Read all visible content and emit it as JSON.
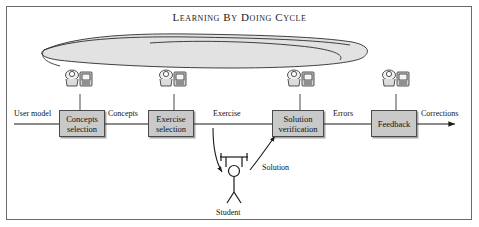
{
  "diagram": {
    "title": "Learning By Doing Cycle",
    "boxes": [
      {
        "id": "concepts-selection",
        "label": "Concepts selection",
        "line1": "Concepts",
        "line2": "selection",
        "x": 59,
        "y": 110,
        "w": 46,
        "h": 27
      },
      {
        "id": "exercise-selection",
        "label": "Exercise selection",
        "line1": "Exercise",
        "line2": "selection",
        "x": 148,
        "y": 110,
        "w": 46,
        "h": 27
      },
      {
        "id": "solution-verification",
        "label": "Solution verification",
        "line1": "Solution",
        "line2": "verification",
        "x": 272,
        "y": 110,
        "w": 52,
        "h": 27
      },
      {
        "id": "feedback",
        "label": "Feedback",
        "line1": "Feedback",
        "line2": "",
        "x": 371,
        "y": 110,
        "w": 46,
        "h": 27
      }
    ],
    "flow_labels": [
      {
        "id": "user-model",
        "text": "User model",
        "x": 14,
        "y": 109
      },
      {
        "id": "concepts",
        "text": "Concepts",
        "x": 108,
        "y": 109
      },
      {
        "id": "exercise",
        "text": "Exercise",
        "x": 213,
        "y": 109
      },
      {
        "id": "errors",
        "text": "Errors",
        "x": 333,
        "y": 109
      },
      {
        "id": "corrections",
        "text": "Corrections",
        "x": 421,
        "y": 109
      },
      {
        "id": "solution",
        "text": "Solution",
        "x": 262,
        "y": 163
      },
      {
        "id": "student",
        "text": "Student",
        "x": 216,
        "y": 208
      }
    ],
    "actors": [
      {
        "id": "teacher-icon-1",
        "x": 63,
        "y": 66
      },
      {
        "id": "teacher-icon-2",
        "x": 157,
        "y": 66
      },
      {
        "id": "teacher-icon-3",
        "x": 285,
        "y": 66
      },
      {
        "id": "teacher-icon-4",
        "x": 380,
        "y": 66
      }
    ],
    "colors": {
      "box_fill": "#c9c9c9",
      "box_border": "#4a4a4a",
      "frame_border": "#6a6a6a",
      "line": "#1a1a1a",
      "cloud_fill": "#d8d8d8",
      "text": "#111111"
    }
  }
}
